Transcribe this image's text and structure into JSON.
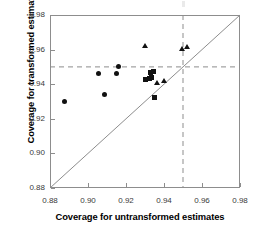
{
  "chart_data": {
    "type": "scatter",
    "title": "",
    "xlabel": "Coverage for untransformed estimates",
    "ylabel": "Coverage for transformed estimates",
    "xlim": [
      0.88,
      0.98
    ],
    "ylim": [
      0.88,
      0.98
    ],
    "xticks": [
      "0.88",
      "0.90",
      "0.92",
      "0.94",
      "0.96",
      "0.98"
    ],
    "yticks": [
      "0.88",
      "0.90",
      "0.92",
      "0.94",
      "0.96",
      "0.98"
    ],
    "xtick_values": [
      0.88,
      0.9,
      0.92,
      0.94,
      0.96,
      0.98
    ],
    "ytick_values": [
      0.88,
      0.9,
      0.92,
      0.94,
      0.96,
      0.98
    ],
    "grid": false,
    "legend": "none",
    "reference_lines": [
      {
        "name": "identity-line",
        "type": "diagonal",
        "from": [
          0.88,
          0.88
        ],
        "to": [
          0.98,
          0.98
        ],
        "style": "solid",
        "color": "#8d8d8d"
      },
      {
        "name": "nominal-coverage-horizontal",
        "type": "horizontal",
        "value": 0.95,
        "style": "dashed",
        "color": "#8d8d8d"
      },
      {
        "name": "nominal-coverage-vertical",
        "type": "vertical",
        "value": 0.95,
        "style": "dashed",
        "color": "#8d8d8d"
      }
    ],
    "series": [
      {
        "name": "circles",
        "marker": "circle",
        "color": "#111111",
        "points": [
          {
            "x": 0.8875,
            "y": 0.93
          },
          {
            "x": 0.9055,
            "y": 0.946
          },
          {
            "x": 0.9085,
            "y": 0.934
          },
          {
            "x": 0.915,
            "y": 0.946
          },
          {
            "x": 0.9158,
            "y": 0.95
          }
        ]
      },
      {
        "name": "squares",
        "marker": "square",
        "color": "#111111",
        "points": [
          {
            "x": 0.93,
            "y": 0.9425
          },
          {
            "x": 0.933,
            "y": 0.947
          },
          {
            "x": 0.9335,
            "y": 0.944
          },
          {
            "x": 0.9345,
            "y": 0.9475
          },
          {
            "x": 0.935,
            "y": 0.9325
          },
          {
            "x": 0.9325,
            "y": 0.9435
          }
        ]
      },
      {
        "name": "triangles",
        "marker": "triangle",
        "color": "#111111",
        "points": [
          {
            "x": 0.93,
            "y": 0.9625
          },
          {
            "x": 0.9365,
            "y": 0.941
          },
          {
            "x": 0.94,
            "y": 0.9418
          },
          {
            "x": 0.9498,
            "y": 0.9608
          },
          {
            "x": 0.952,
            "y": 0.9618
          }
        ]
      }
    ]
  }
}
